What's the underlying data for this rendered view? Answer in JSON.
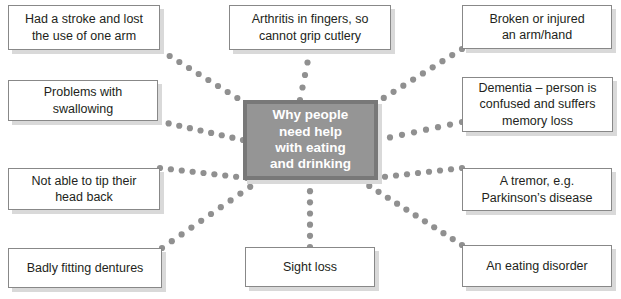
{
  "diagram": {
    "center": {
      "label": "Why people\nneed help\nwith eating\nand drinking",
      "fill_color": "#959595",
      "border_color": "#787878",
      "text_color": "#ffffff"
    },
    "connector": {
      "style": "dotted",
      "dot_color": "#909090",
      "dot_radius": 3.1
    },
    "node_style": {
      "fill_color": "#ffffff",
      "border_color": "#888888",
      "shadow_color": "#d9d9d9",
      "text_color": "#231f20"
    },
    "nodes": [
      {
        "id": "stroke",
        "label": "Had a stroke and lost\nthe use of one arm",
        "x": 8,
        "y": 5,
        "w": 152,
        "h": 45,
        "anchor": {
          "x": 160,
          "y": 50
        }
      },
      {
        "id": "swallowing",
        "label": "Problems with\nswallowing",
        "x": 8,
        "y": 80,
        "w": 150,
        "h": 41,
        "anchor": {
          "x": 158,
          "y": 121
        }
      },
      {
        "id": "head-back",
        "label": "Not able to tip their\nhead back",
        "x": 8,
        "y": 168,
        "w": 152,
        "h": 42,
        "anchor": {
          "x": 160,
          "y": 168
        }
      },
      {
        "id": "dentures",
        "label": "Badly fitting dentures",
        "x": 8,
        "y": 248,
        "w": 154,
        "h": 40,
        "anchor": {
          "x": 162,
          "y": 248
        }
      },
      {
        "id": "arthritis",
        "label": "Arthritis in fingers, so\ncannot grip cutlery",
        "x": 229,
        "y": 5,
        "w": 162,
        "h": 45,
        "anchor": {
          "x": 310,
          "y": 50
        }
      },
      {
        "id": "sight-loss",
        "label": "Sight loss",
        "x": 245,
        "y": 247,
        "w": 130,
        "h": 40,
        "anchor": {
          "x": 310,
          "y": 247
        }
      },
      {
        "id": "broken-arm",
        "label": "Broken or injured\nan arm/hand",
        "x": 462,
        "y": 5,
        "w": 150,
        "h": 44,
        "anchor": {
          "x": 462,
          "y": 49
        }
      },
      {
        "id": "dementia",
        "label": "Dementia – person is\nconfused and suffers\nmemory loss",
        "x": 462,
        "y": 77,
        "w": 151,
        "h": 55,
        "anchor": {
          "x": 462,
          "y": 122
        }
      },
      {
        "id": "tremor",
        "label": "A tremor, e.g.\nParkinson’s disease",
        "x": 462,
        "y": 168,
        "w": 150,
        "h": 43,
        "anchor": {
          "x": 462,
          "y": 168
        }
      },
      {
        "id": "eating-disorder",
        "label": "An eating disorder",
        "x": 462,
        "y": 245,
        "w": 150,
        "h": 42,
        "anchor": {
          "x": 462,
          "y": 245
        }
      }
    ],
    "center_box": {
      "x": 243,
      "y": 100,
      "w": 135,
      "h": 80
    },
    "center_anchors": {
      "stroke": {
        "x": 247,
        "y": 104
      },
      "swallowing": {
        "x": 243,
        "y": 140
      },
      "head-back": {
        "x": 247,
        "y": 178
      },
      "dentures": {
        "x": 260,
        "y": 180
      },
      "arthritis": {
        "x": 300,
        "y": 100
      },
      "sight-loss": {
        "x": 310,
        "y": 180
      },
      "broken-arm": {
        "x": 374,
        "y": 104
      },
      "dementia": {
        "x": 378,
        "y": 140
      },
      "tremor": {
        "x": 374,
        "y": 178
      },
      "eating-disorder": {
        "x": 360,
        "y": 180
      }
    }
  }
}
